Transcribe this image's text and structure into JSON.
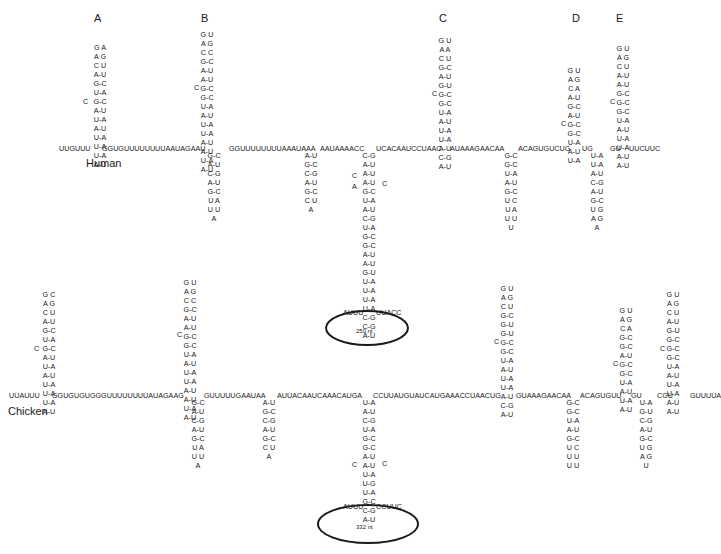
{
  "figure": {
    "stem_labels": [
      "A",
      "B",
      "C",
      "D",
      "E"
    ],
    "species": [
      "Human",
      "Chicken"
    ]
  },
  "human": {
    "label": "Human",
    "backbone_segments": [
      "UUGUUU",
      "GGUGUUUUUUUUAAUAGAAU",
      "GGUUUUUUUUAAAUAAA",
      "AAUAAAACC",
      "UCACAAUCCUAAC",
      "AUAAAGAACAA",
      "ACAGUGUCUG",
      "UG",
      "GU",
      "UUCUUC"
    ],
    "hairpins_up": {
      "A": {
        "loop": [
          "G  A",
          "A      G",
          "C   U"
        ],
        "pairs": [
          "A-U",
          "G-C",
          "U-A",
          "G-C",
          "A-U",
          "U-A",
          "A-U",
          "U-A",
          "U-A",
          "U-A",
          "A-U"
        ],
        "bulge": "C"
      },
      "B": {
        "loop": [
          "G  U",
          "A      G",
          "C   C"
        ],
        "pairs": [
          "G-C",
          "A-U",
          "A-U",
          "G-C",
          "G-C",
          "U-A",
          "A-U",
          "U-A",
          "U-A",
          "A-U",
          "A-U",
          "U-A",
          "A-U"
        ],
        "bulge": "C"
      },
      "C": {
        "loop": [
          "G  U",
          "A      A",
          "C   U"
        ],
        "pairs": [
          "G-C",
          "A-U",
          "G-U",
          "G-C",
          "G-C",
          "U-A",
          "A-U",
          "U-A",
          "U-A",
          "A-U",
          "C-G",
          "A-U"
        ],
        "bulge": "C"
      },
      "D": {
        "loop": [
          "G  U",
          "A      G",
          "C   A"
        ],
        "pairs": [
          "A-U",
          "G-C",
          "A-U",
          "G-C",
          "G-C",
          "U-A",
          "A-U",
          "U-A"
        ],
        "bulge": "C"
      },
      "E": {
        "loop": [
          "G  U",
          "A      G",
          "C   U"
        ],
        "pairs": [
          "A-U",
          "A-U",
          "G-C",
          "G-C",
          "G-C",
          "U-A",
          "A-U",
          "U-A",
          "U-A",
          "A-U",
          "A-U"
        ],
        "bulge": "C"
      }
    },
    "hairpins_down": [
      {
        "pairs": [
          "G-C",
          "A-U",
          "C-G",
          "A-U",
          "G-C"
        ],
        "loop": [
          "U   A",
          "U      U",
          "A"
        ]
      },
      {
        "pairs": [
          "A-U",
          "G-C",
          "C-G",
          "A-U",
          "G-C"
        ],
        "loop": [
          "C   U",
          "A"
        ]
      },
      {
        "pairs": [
          "G-C",
          "G-C",
          "U-A",
          "A-U",
          "G-C"
        ],
        "loop": [
          "U   C",
          "U      A",
          "U  U",
          "U"
        ]
      },
      {
        "pairs": [
          "U-A",
          "U-A",
          "A-U",
          "C-G",
          "A-U",
          "G-C"
        ],
        "loop": [
          "U   G",
          "A     G",
          "A"
        ]
      }
    ],
    "long_stem": {
      "pairs": [
        "C-G",
        "A-U",
        "A-U",
        "A-U",
        "G-C",
        "U-A",
        "A-U",
        "C-G",
        "U-A",
        "G-C",
        "G-C",
        "A-U",
        "A-U",
        "G-U",
        "U-A",
        "U-A",
        "U-A",
        "U-A",
        "C-G",
        "C-G",
        "A-U"
      ],
      "bulges": [
        "C",
        "A",
        "C"
      ],
      "loop_left": "AUUU",
      "loop_right": "UUACC",
      "loop_size": "250 nt"
    }
  },
  "chicken": {
    "label": "Chicken",
    "backbone_segments": [
      "UUAUUU",
      "GGUGUGUGGGUUUUUUUUAUAGAAG",
      "GUUUUUGAAUAA",
      "AUUACAAUCAAACAUGA",
      "CCUUAUGUAUCAUGAAACCUAACUG",
      "GUAAAGAACAA",
      "ACAGUGUU",
      "GU",
      "CGU",
      "GUUUUA"
    ],
    "hairpins_up": {
      "A": {
        "loop": [
          "G  C",
          "A      G",
          "C   U"
        ],
        "pairs": [
          "A-U",
          "G-C",
          "U-A",
          "G-C",
          "A-U",
          "U-A",
          "A-U",
          "U-A",
          "U-A",
          "U-A",
          "A-U"
        ],
        "bulge": "C"
      },
      "B": {
        "loop": [
          "G  U",
          "A      G",
          "C   C"
        ],
        "pairs": [
          "G-C",
          "A-U",
          "A-U",
          "G-C",
          "G-C",
          "U-A",
          "A-U",
          "U-A",
          "U-A",
          "A-U",
          "A-U",
          "U-A",
          "A-U"
        ],
        "bulge": "C"
      },
      "C": {
        "loop": [
          "G  U",
          "A      G",
          "C   U"
        ],
        "pairs": [
          "G-C",
          "G-U",
          "G-U",
          "G-C",
          "G-C",
          "U-A",
          "A-U",
          "U-A",
          "U-A",
          "A-U",
          "C-G",
          "A-U"
        ],
        "bulge": "C"
      },
      "D": {
        "loop": [
          "G  U",
          "A      G",
          "C   A"
        ],
        "pairs": [
          "G-C",
          "G-C",
          "A-U",
          "G-C",
          "G-C",
          "U-A",
          "A-U",
          "U-A",
          "A-U"
        ],
        "bulge": "C"
      },
      "E": {
        "loop": [
          "G  U",
          "A      G",
          "C   U"
        ],
        "pairs": [
          "A-U",
          "G-U",
          "G-C",
          "G-C",
          "G-C",
          "U-A",
          "A-U",
          "U-A",
          "U-A",
          "A-U",
          "A-U"
        ],
        "bulge": "C"
      }
    },
    "hairpins_down": [
      {
        "pairs": [
          "G-C",
          "A-U",
          "C-G",
          "A-U",
          "G-C"
        ],
        "loop": [
          "U   A",
          "U      U",
          "A"
        ]
      },
      {
        "pairs": [
          "A-U",
          "G-C",
          "C-G",
          "A-U",
          "G-C"
        ],
        "loop": [
          "C   U",
          "A"
        ]
      },
      {
        "pairs": [
          "G-C",
          "G-C",
          "U-A",
          "A-U",
          "G-C"
        ],
        "loop": [
          "U   C",
          "U      U",
          "U  U"
        ]
      },
      {
        "pairs": [
          "U-A",
          "G-U",
          "C-G",
          "A-U",
          "G-C"
        ],
        "loop": [
          "U   G",
          "A     G",
          "U"
        ]
      }
    ],
    "long_stem": {
      "pairs": [
        "U-A",
        "A-U",
        "C-G",
        "U-A",
        "G-C",
        "G-C",
        "A-U",
        "A-U",
        "U-A",
        "U-G",
        "U-A",
        "G-C",
        "C-G",
        "A-U"
      ],
      "bulges": [
        "C",
        "C"
      ],
      "loop_left": "AUUU",
      "loop_right": "CCUUC",
      "loop_size": "332 nt"
    }
  }
}
